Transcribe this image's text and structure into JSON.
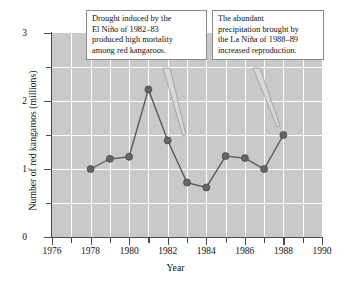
{
  "chart_data": {
    "type": "line",
    "title": "",
    "xlabel": "Year",
    "ylabel": "Number of red kangaroos (millions)",
    "xlim": [
      1976,
      1990
    ],
    "ylim": [
      0,
      3
    ],
    "xticks": [
      1976,
      1978,
      1980,
      1982,
      1984,
      1986,
      1988,
      1990
    ],
    "xticklabels": [
      "1976",
      "1978",
      "1980",
      "1982",
      "1984",
      "1986",
      "1988",
      "1990"
    ],
    "xminorticks": [
      1977,
      1979,
      1981,
      1983,
      1985,
      1987,
      1989
    ],
    "yticks": [
      0,
      1,
      2,
      3
    ],
    "yticklabels": [
      "0",
      "1",
      "2",
      "3"
    ],
    "yminorticks": [
      0.5,
      1.5,
      2.5
    ],
    "grid": true,
    "grid_color": "#ffffff",
    "plot_background": "#c9c9c9",
    "marker_color": "#666666",
    "line_color": "#555555",
    "x": [
      1978,
      1979,
      1980,
      1981,
      1982,
      1983,
      1984,
      1985,
      1986,
      1987,
      1988
    ],
    "values": [
      1.0,
      1.15,
      1.18,
      2.17,
      1.42,
      0.8,
      0.73,
      1.19,
      1.16,
      1.0,
      1.5
    ],
    "annotations": [
      {
        "name": "drought-callout",
        "lines": [
          "Drought induced by the",
          "El Niño of 1982–83",
          "produced high mortality",
          "among red kangaroos."
        ],
        "points_to_year": 1983
      },
      {
        "name": "precipitation-callout",
        "lines": [
          "The abundant",
          "precipitation brought by",
          "the La Niña of 1988–89",
          "increased reproduction."
        ],
        "points_to_year": 1988
      }
    ]
  }
}
